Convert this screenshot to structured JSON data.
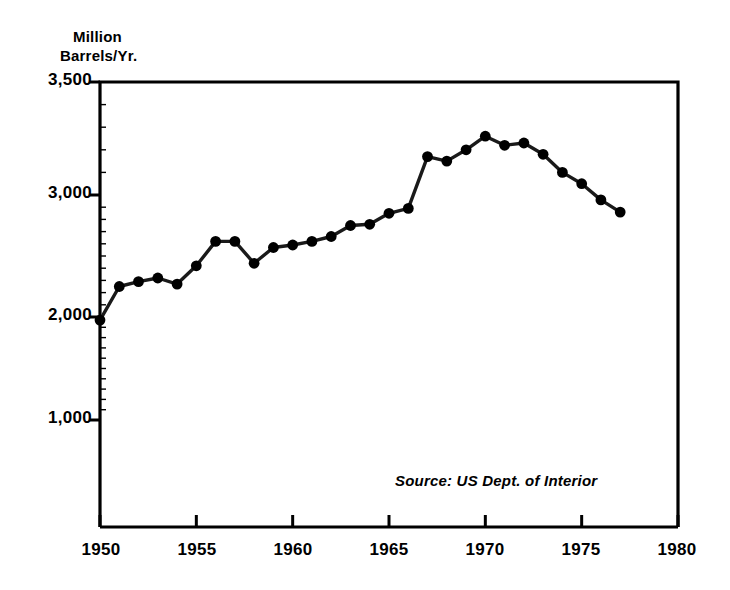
{
  "chart_data": {
    "type": "line",
    "title": "",
    "subtitle": "",
    "xlabel": "",
    "ylabel": "Million Barrels/Yr.",
    "ylabel_lines": [
      "Million",
      "Barrels/Yr."
    ],
    "xlim": [
      1950,
      1980
    ],
    "ylim": [
      0,
      3500
    ],
    "grid": false,
    "legend": null,
    "annotations": [
      {
        "name": "source-note",
        "text": "Source: US Dept. of Interior"
      }
    ],
    "yticks": [
      1000,
      2000,
      3000,
      3500
    ],
    "ytick_labels": [
      "1,000",
      "2,000",
      "3,000",
      "3,500"
    ],
    "xticks": [
      1950,
      1955,
      1960,
      1965,
      1970,
      1975,
      1980
    ],
    "xtick_labels": [
      "1950",
      "1955",
      "1960",
      "1965",
      "1970",
      "1975",
      "1980"
    ],
    "marker": "filled-circle",
    "line_color": "#000000",
    "marker_color": "#000000",
    "x": [
      1950,
      1951,
      1952,
      1953,
      1954,
      1955,
      1956,
      1957,
      1958,
      1959,
      1960,
      1961,
      1962,
      1963,
      1964,
      1965,
      1966,
      1967,
      1968,
      1969,
      1970,
      1971,
      1972,
      1973,
      1974,
      1975,
      1976,
      1977
    ],
    "values": [
      1970,
      2250,
      2290,
      2320,
      2270,
      2420,
      2620,
      2620,
      2440,
      2570,
      2590,
      2620,
      2660,
      2750,
      2760,
      2850,
      2890,
      3170,
      3150,
      3200,
      3260,
      3220,
      3230,
      3180,
      3100,
      3050,
      2960,
      2860
    ],
    "series": [
      {
        "name": "US Oil Production",
        "values": [
          1970,
          2250,
          2290,
          2320,
          2270,
          2420,
          2620,
          2620,
          2440,
          2570,
          2590,
          2620,
          2660,
          2750,
          2760,
          2850,
          2890,
          3170,
          3150,
          3200,
          3260,
          3220,
          3230,
          3180,
          3100,
          3050,
          2960,
          2860
        ]
      }
    ]
  },
  "labels": {
    "ylabel_line1": "Million",
    "ylabel_line2": "Barrels/Yr.",
    "ytick_3500": "3,500",
    "ytick_3000": "3,000",
    "ytick_2000": "2,000",
    "ytick_1000": "1,000",
    "xtick_1950": "1950",
    "xtick_1955": "1955",
    "xtick_1960": "1960",
    "xtick_1965": "1965",
    "xtick_1970": "1970",
    "xtick_1975": "1975",
    "xtick_1980": "1980",
    "source": "Source: US Dept. of Interior"
  },
  "colors": {
    "ink": "#000000",
    "background": "#ffffff"
  }
}
